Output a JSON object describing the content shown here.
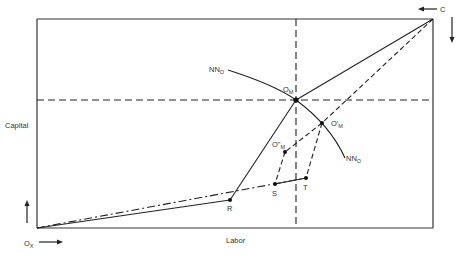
{
  "diagram": {
    "type": "edgeworth-box",
    "axes": {
      "x_label": "Labor",
      "y_label": "Capital"
    },
    "origins": {
      "bottom_left": {
        "main": "O",
        "sub": "X"
      },
      "top_right": {
        "main": "C"
      }
    },
    "curve": {
      "label_top": {
        "main": "NN",
        "sub": "O"
      },
      "label_bottom": {
        "main": "NN",
        "sub": "O"
      }
    },
    "points": {
      "om": {
        "main": "O",
        "sub": "M"
      },
      "om_prime": {
        "main": "O'",
        "sub": "M"
      },
      "om_double_prime": {
        "main": "O\"",
        "sub": "M"
      },
      "r": "R",
      "s": "S",
      "t": "T"
    },
    "colors": {
      "line": "#222222",
      "text": "#333333",
      "background": "#ffffff"
    }
  }
}
